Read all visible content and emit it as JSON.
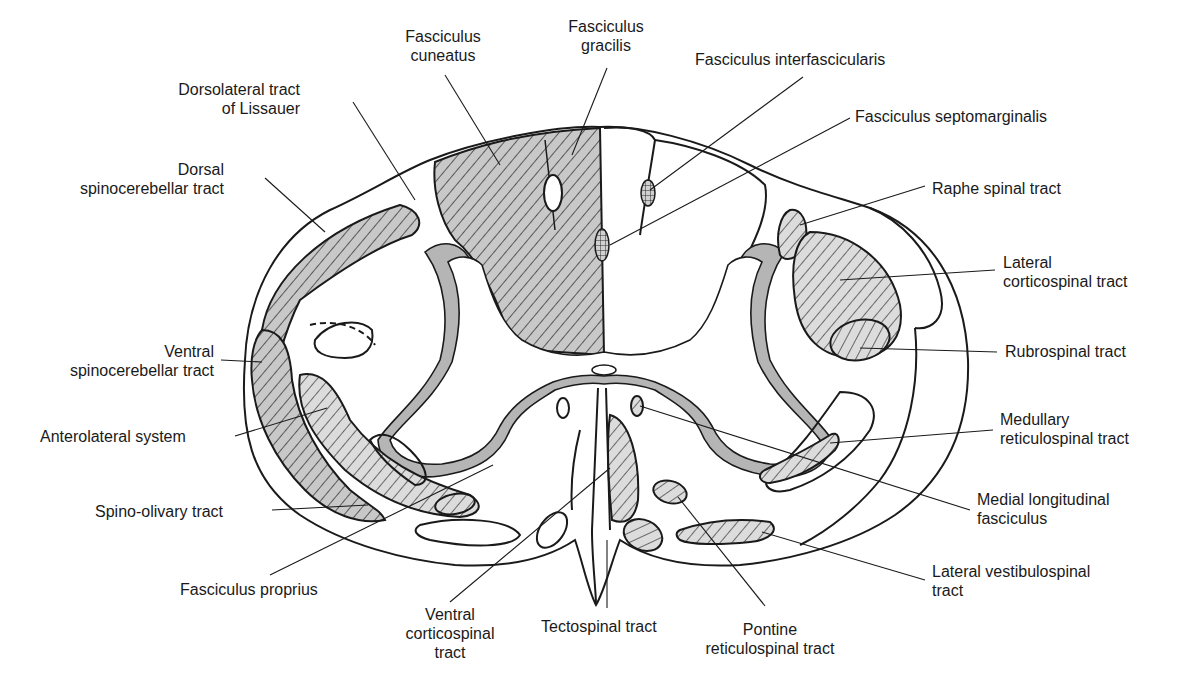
{
  "diagram": {
    "colors": {
      "outline": "#1a1a1a",
      "gray_matter_rim": "#b5b5b5",
      "tract_fill": "#c8c8c8",
      "background": "#ffffff"
    }
  },
  "labels": {
    "fasciculus_cuneatus": {
      "line1": "Fasciculus",
      "line2": "cuneatus"
    },
    "fasciculus_gracilis": {
      "line1": "Fasciculus",
      "line2": "gracilis"
    },
    "fasciculus_interfascicularis": {
      "line1": "Fasciculus interfascicularis"
    },
    "fasciculus_septomarginalis": {
      "line1": "Fasciculus septomarginalis"
    },
    "dorsolateral_tract": {
      "line1": "Dorsolateral tract",
      "line2": "of Lissauer"
    },
    "dorsal_spinocerebellar": {
      "line1": "Dorsal",
      "line2": "spinocerebellar tract"
    },
    "raphe_spinal": {
      "line1": "Raphe spinal tract"
    },
    "lateral_corticospinal": {
      "line1": "Lateral",
      "line2": "corticospinal tract"
    },
    "rubrospinal": {
      "line1": "Rubrospinal tract"
    },
    "ventral_spinocerebellar": {
      "line1": "Ventral",
      "line2": "spinocerebellar tract"
    },
    "anterolateral_system": {
      "line1": "Anterolateral system"
    },
    "medullary_reticulospinal": {
      "line1": "Medullary",
      "line2": "reticulospinal tract"
    },
    "medial_longitudinal": {
      "line1": "Medial longitudinal",
      "line2": "fasciculus"
    },
    "spino_olivary": {
      "line1": "Spino-olivary tract"
    },
    "lateral_vestibulospinal": {
      "line1": "Lateral vestibulospinal",
      "line2": "tract"
    },
    "fasciculus_proprius": {
      "line1": "Fasciculus proprius"
    },
    "ventral_corticospinal": {
      "line1": "Ventral",
      "line2": "corticospinal",
      "line3": "tract"
    },
    "tectospinal": {
      "line1": "Tectospinal tract"
    },
    "pontine_reticulospinal": {
      "line1": "Pontine",
      "line2": "reticulospinal tract"
    }
  }
}
